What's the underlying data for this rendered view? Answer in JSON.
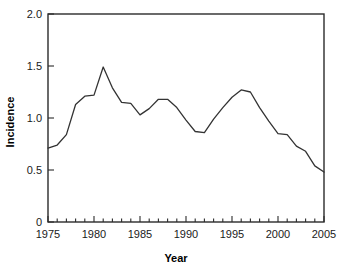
{
  "chart_data": {
    "type": "line",
    "title": "",
    "xlabel": "Year",
    "ylabel": "Incidence",
    "xlim": [
      1975,
      2005
    ],
    "ylim": [
      0,
      2.0
    ],
    "grid": false,
    "legend": null,
    "x_tick_labels": [
      "1975",
      "1980",
      "1985",
      "1990",
      "1995",
      "2000",
      "2005"
    ],
    "x_tick_values": [
      1975,
      1980,
      1985,
      1990,
      1995,
      2000,
      2005
    ],
    "x_minor_tick_interval": 1,
    "y_tick_labels": [
      "0",
      "0.5",
      "1.0",
      "1.5",
      "2.0"
    ],
    "y_tick_values": [
      0,
      0.5,
      1.0,
      1.5,
      2.0
    ],
    "line_color": "#333333",
    "axis_color": "#2b2b2b",
    "background_color": "#ffffff",
    "x": [
      1975,
      1976,
      1977,
      1978,
      1979,
      1980,
      1981,
      1982,
      1983,
      1984,
      1985,
      1986,
      1987,
      1988,
      1989,
      1990,
      1991,
      1992,
      1993,
      1994,
      1995,
      1996,
      1997,
      1998,
      1999,
      2000,
      2001,
      2002,
      2003,
      2004,
      2005
    ],
    "values": [
      0.71,
      0.74,
      0.84,
      1.13,
      1.21,
      1.22,
      1.49,
      1.29,
      1.15,
      1.14,
      1.03,
      1.09,
      1.18,
      1.18,
      1.1,
      0.98,
      0.87,
      0.86,
      0.99,
      1.1,
      1.2,
      1.27,
      1.25,
      1.1,
      0.97,
      0.85,
      0.84,
      0.73,
      0.68,
      0.54,
      0.48
    ],
    "series": [
      {
        "name": "Incidence",
        "values": [
          0.71,
          0.74,
          0.84,
          1.13,
          1.21,
          1.22,
          1.49,
          1.29,
          1.15,
          1.14,
          1.03,
          1.09,
          1.18,
          1.18,
          1.1,
          0.98,
          0.87,
          0.86,
          0.99,
          1.1,
          1.2,
          1.27,
          1.25,
          1.1,
          0.97,
          0.85,
          0.84,
          0.73,
          0.68,
          0.54,
          0.48
        ]
      }
    ]
  }
}
